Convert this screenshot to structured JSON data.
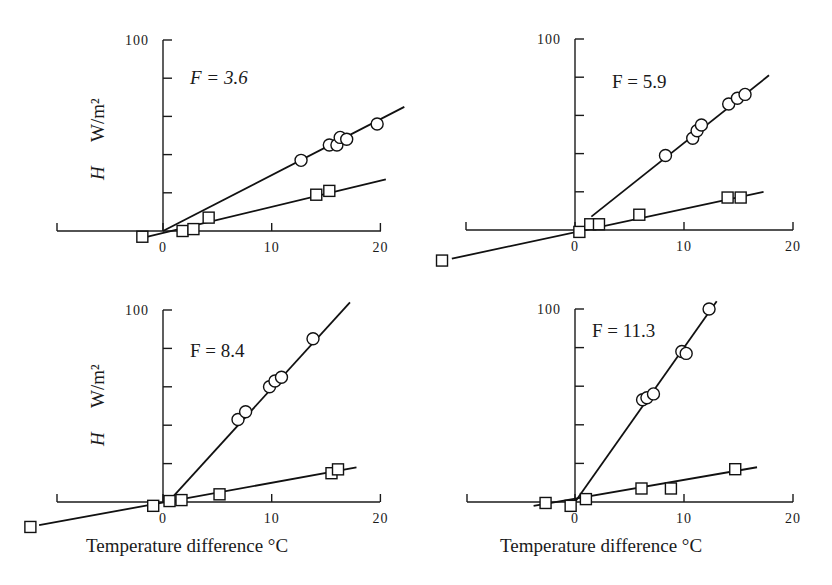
{
  "figure": {
    "y_axis_label_H": "H",
    "y_axis_label_units": "W/m²",
    "x_axis_label": "Temperature difference °C",
    "panels": [
      {
        "f_label": "F = 3.6"
      },
      {
        "f_label": "F = 5.9"
      },
      {
        "f_label": "F = 8.4"
      },
      {
        "f_label": "F = 11.3"
      }
    ]
  },
  "chart_data": [
    {
      "type": "scatter",
      "title": "F = 3.6",
      "xlabel": "",
      "ylabel": "H W/m²",
      "xlim": [
        -15,
        20
      ],
      "ylim": [
        0,
        100
      ],
      "xticks": [
        0,
        10,
        20
      ],
      "yticks": [
        0,
        20,
        40,
        60,
        80,
        100
      ],
      "ytick_labels_shown": [
        "100"
      ],
      "grid": false,
      "series": [
        {
          "name": "circles",
          "marker": "circle",
          "x": [
            12.7,
            15.3,
            16.0,
            16.3,
            16.9,
            19.7
          ],
          "y": [
            37,
            45,
            45,
            49,
            48,
            56
          ],
          "fit_line": [
            [
              0,
              0
            ],
            [
              22.2,
              65
            ]
          ]
        },
        {
          "name": "squares",
          "marker": "square",
          "x": [
            -1.9,
            1.8,
            2.8,
            4.2,
            14.1,
            15.3
          ],
          "y": [
            -3,
            0,
            1,
            7,
            19,
            21
          ],
          "fit_line": [
            [
              -1.4,
              -3
            ],
            [
              20.5,
              27
            ]
          ]
        }
      ]
    },
    {
      "type": "scatter",
      "title": "F = 5.9",
      "xlabel": "",
      "ylabel": "",
      "xlim": [
        -15,
        20
      ],
      "ylim": [
        0,
        100
      ],
      "xticks": [
        0,
        10,
        20
      ],
      "yticks": [
        0,
        20,
        40,
        60,
        80,
        100
      ],
      "ytick_labels_shown": [
        "100"
      ],
      "grid": false,
      "series": [
        {
          "name": "circles",
          "marker": "circle",
          "x": [
            8.3,
            10.8,
            11.2,
            11.6,
            14.1,
            14.9,
            15.6
          ],
          "y": [
            39,
            48,
            52,
            55,
            66,
            69,
            71
          ],
          "fit_line": [
            [
              1.5,
              7
            ],
            [
              17.8,
              81
            ]
          ]
        },
        {
          "name": "squares",
          "marker": "square",
          "x": [
            -12.2,
            0.4,
            1.4,
            2.2,
            5.9,
            14.0,
            15.2
          ],
          "y": [
            -16,
            -1,
            3,
            3,
            8,
            17,
            17
          ],
          "fit_line": [
            [
              -11.3,
              -15
            ],
            [
              17.3,
              20
            ]
          ]
        }
      ]
    },
    {
      "type": "scatter",
      "title": "F = 8.4",
      "xlabel": "Temperature difference °C",
      "ylabel": "H W/m²",
      "xlim": [
        -15,
        20
      ],
      "ylim": [
        0,
        100
      ],
      "xticks": [
        0,
        10,
        20
      ],
      "yticks": [
        0,
        20,
        40,
        60,
        80,
        100
      ],
      "ytick_labels_shown": [
        "100"
      ],
      "grid": false,
      "series": [
        {
          "name": "circles",
          "marker": "circle",
          "x": [
            6.9,
            7.6,
            9.8,
            10.3,
            10.9,
            13.8
          ],
          "y": [
            43,
            47,
            60,
            63,
            65,
            85
          ],
          "fit_line": [
            [
              0.8,
              2
            ],
            [
              17.2,
              104
            ]
          ]
        },
        {
          "name": "squares",
          "marker": "square",
          "x": [
            -12.2,
            -0.9,
            0.6,
            1.7,
            5.2,
            15.5,
            16.1
          ],
          "y": [
            -13,
            -2,
            0.5,
            1,
            4,
            15,
            17
          ],
          "fit_line": [
            [
              -11.4,
              -12
            ],
            [
              17.8,
              18
            ]
          ]
        }
      ]
    },
    {
      "type": "scatter",
      "title": "F = 11.3",
      "xlabel": "Temperature difference °C",
      "ylabel": "",
      "xlim": [
        -15,
        20
      ],
      "ylim": [
        0,
        100
      ],
      "xticks": [
        0,
        10,
        20
      ],
      "yticks": [
        0,
        20,
        40,
        60,
        80,
        100
      ],
      "ytick_labels_shown": [
        "100"
      ],
      "grid": false,
      "series": [
        {
          "name": "circles",
          "marker": "circle",
          "x": [
            6.2,
            6.6,
            7.2,
            9.8,
            10.2,
            12.3
          ],
          "y": [
            53,
            54,
            56,
            78,
            77,
            100
          ],
          "fit_line": [
            [
              0,
              0
            ],
            [
              13.0,
              104
            ]
          ]
        },
        {
          "name": "squares",
          "marker": "square",
          "x": [
            -2.7,
            -0.4,
            1.0,
            6.1,
            8.8,
            14.7
          ],
          "y": [
            -0.5,
            -2,
            1.5,
            7,
            7,
            17
          ],
          "fit_line": [
            [
              -3.8,
              -2
            ],
            [
              16.7,
              18
            ]
          ]
        }
      ]
    }
  ]
}
